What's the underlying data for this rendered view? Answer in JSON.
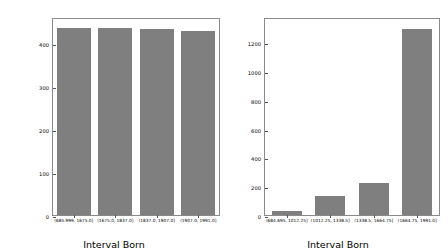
{
  "chart_data": [
    {
      "type": "bar",
      "title": "",
      "xlabel": "Interval Born",
      "ylabel": "Number of people born in interval",
      "categories": [
        "(685.999, 1675.0]",
        "(1675.0, 1837.0]",
        "(1837.0, 1907.0]",
        "(1907.0, 1991.0]"
      ],
      "values": [
        433,
        434,
        432,
        428
      ],
      "ylim": [
        0,
        455
      ],
      "yticks": [
        0,
        100,
        200,
        300,
        400
      ],
      "ytick_labels": [
        "0",
        "100",
        "200",
        "300",
        "400"
      ],
      "grid": false,
      "legend": "none",
      "bar_color": "#7f7f7f"
    },
    {
      "type": "bar",
      "title": "",
      "xlabel": "Interval Born",
      "ylabel": "",
      "categories": [
        "(684.695, 1012.25]",
        "(1012.25, 1338.5]",
        "(1338.5, 1664.75]",
        "(1664.75, 1991.0]"
      ],
      "values": [
        26,
        131,
        224,
        1290
      ],
      "ylim": [
        0,
        1360
      ],
      "yticks": [
        0,
        200,
        400,
        600,
        800,
        1000,
        1200
      ],
      "ytick_labels": [
        "0",
        "200",
        "400",
        "600",
        "800",
        "1000",
        "1200"
      ],
      "grid": false,
      "legend": "none",
      "bar_color": "#7f7f7f"
    }
  ],
  "figure": {
    "background": "#ffffff",
    "axis_color": "#8a8a8a"
  }
}
